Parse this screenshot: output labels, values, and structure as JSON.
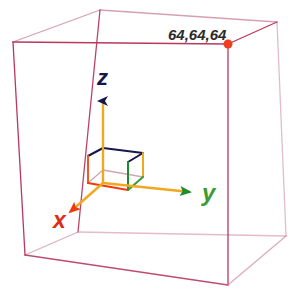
{
  "viewport": {
    "name": "3d-axes-viewport",
    "width": 288,
    "height": 296,
    "background": "#ffffff"
  },
  "corner_label": {
    "text": "64,64,64",
    "color": "#2b2b2b",
    "x": 168,
    "y": 40
  },
  "corner_marker": {
    "name": "corner-point-marker",
    "color": "#f03c20",
    "x": 228,
    "y": 44,
    "r": 4.5
  },
  "bounding_box": {
    "name": "bounding-box-wireframe",
    "color": "#b8385e",
    "color_faint": "#cf8fa4",
    "stroke": 1.3,
    "vertices": {
      "top_back_left": [
        13,
        42
      ],
      "top_apex": [
        100,
        10
      ],
      "top_back_right": [
        277,
        22
      ],
      "top_front_right": [
        228,
        44
      ],
      "bottom_back_left": [
        25,
        255
      ],
      "bottom_apex": [
        78,
        232
      ],
      "bottom_back_right": [
        286,
        236
      ],
      "bottom_front_right": [
        228,
        285
      ]
    }
  },
  "axes": [
    {
      "id": "z",
      "label": "z",
      "label_color": "#15184a",
      "arrow_color": "#15184a",
      "shaft_color": "#f0a81e",
      "label_x": 97,
      "label_y": 85,
      "origin": [
        103,
        183
      ],
      "tip": [
        103,
        101
      ]
    },
    {
      "id": "y",
      "label": "y",
      "label_color": "#3a9b34",
      "arrow_color": "#1f8c2e",
      "shaft_color": "#f0a81e",
      "label_x": 202,
      "label_y": 201,
      "origin": [
        103,
        183
      ],
      "tip": [
        190,
        192
      ]
    },
    {
      "id": "x",
      "label": "x",
      "label_color": "#e02b18",
      "arrow_color": "#ef3a10",
      "shaft_color": "#f0a81e",
      "label_x": 53,
      "label_y": 228,
      "origin": [
        103,
        183
      ],
      "tip": [
        70,
        212
      ]
    }
  ],
  "unit_cube": {
    "name": "unit-cube-at-origin",
    "colors": {
      "top_back": "#15184a",
      "left_vertical": "#ef5a22",
      "right_vertical": "#1f8c2e",
      "bottom_front": "#ef3a10",
      "bottom_right": "#3a9b34",
      "shaft_yellow": "#f0a81e",
      "hidden": "#c090a0"
    },
    "stroke": 2.0,
    "vertices": {
      "front_bottom_left": [
        88,
        183
      ],
      "front_bottom_right": [
        128,
        190
      ],
      "front_top_left": [
        88,
        156
      ],
      "front_top_right": [
        128,
        162
      ],
      "back_bottom_left": [
        103,
        170
      ],
      "back_bottom_right": [
        143,
        177
      ],
      "back_top_left": [
        103,
        148
      ],
      "back_top_right": [
        143,
        153
      ]
    }
  }
}
